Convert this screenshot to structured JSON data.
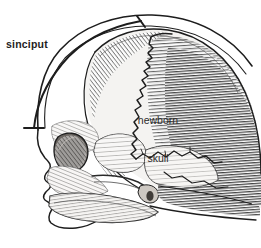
{
  "figure": {
    "name": "newborn-skull-lateral-diagram",
    "background_color": "#ffffff",
    "ink_color": "#1d1d1d",
    "bone_fill": "#f4f3f1",
    "shade_color": "#6e6e6e",
    "width": 261,
    "height": 248
  },
  "labels": {
    "sinciput": "sinciput",
    "newborn_line1": "newborn",
    "newborn_line2": "skull"
  },
  "annotations": {
    "bracket": {
      "name": "sinciput-bracket",
      "description": "curved measuring bracket with perpendicular end caps spanning the forehead region",
      "top_cap_y": 21,
      "bottom_cap_y": 128
    }
  },
  "anatomy": {
    "parts": [
      "scalp-outline",
      "facial-profile",
      "frontal-bone",
      "parietal-bone",
      "occipital-region",
      "coronal-suture",
      "sagittal-suture",
      "orbit",
      "sphenoid-wing",
      "temporal-bone",
      "maxilla",
      "mandible",
      "mastoid-process"
    ]
  }
}
